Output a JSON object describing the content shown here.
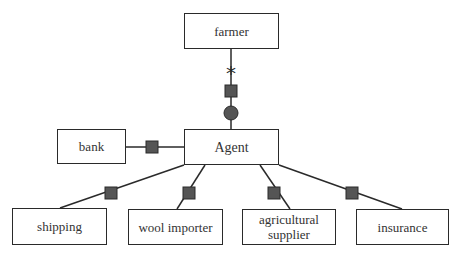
{
  "diagram": {
    "nodes": {
      "farmer": {
        "label": "farmer"
      },
      "agent": {
        "label": "Agent"
      },
      "bank": {
        "label": "bank"
      },
      "shipping": {
        "label": "shipping"
      },
      "wool_importer": {
        "label": "wool importer"
      },
      "agricultural_supplier": {
        "label": "agricultural supplier"
      },
      "insurance": {
        "label": "insurance"
      }
    },
    "edges": [
      {
        "from": "farmer",
        "to": "agent",
        "multiplicity": "*",
        "connector": "square",
        "end": "circle"
      },
      {
        "from": "bank",
        "to": "agent",
        "connector": "square"
      },
      {
        "from": "agent",
        "to": "shipping",
        "connector": "square"
      },
      {
        "from": "agent",
        "to": "wool_importer",
        "connector": "square"
      },
      {
        "from": "agent",
        "to": "agricultural_supplier",
        "connector": "square"
      },
      {
        "from": "agent",
        "to": "insurance",
        "connector": "square"
      }
    ],
    "multiplicity_label": "*",
    "colors": {
      "line": "#2a2a2a",
      "connector_fill": "#555555",
      "text": "#333333"
    }
  }
}
